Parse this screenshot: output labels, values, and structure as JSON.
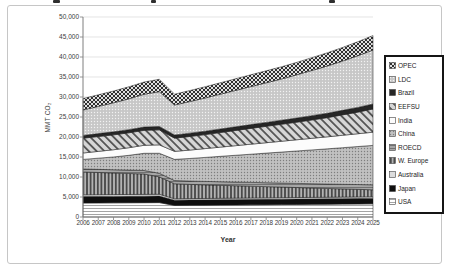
{
  "chart_data": {
    "type": "area",
    "stacked": true,
    "xlabel": "Year",
    "ylabel": "MMT CO2",
    "ylabel_display": "MMT CO₂",
    "x": [
      2006,
      2007,
      2008,
      2009,
      2010,
      2011,
      2012,
      2013,
      2014,
      2015,
      2016,
      2017,
      2018,
      2019,
      2020,
      2021,
      2022,
      2023,
      2024,
      2025
    ],
    "ylim": [
      0,
      50000
    ],
    "ytick_step": 5000,
    "y_tick_labels": [
      "0",
      "5,000",
      "10,000",
      "15,000",
      "20,000",
      "25,000",
      "30,000",
      "35,000",
      "40,000",
      "45,000",
      "50,000"
    ],
    "grid": true,
    "legend_position": "right",
    "legend_order_top_to_bottom": [
      "OPEC",
      "LDC",
      "Brazil",
      "EEFSU",
      "India",
      "China",
      "ROECD",
      "W. Europe",
      "Australia",
      "Japan",
      "USA"
    ],
    "series": [
      {
        "name": "USA",
        "pattern": "horizontal-lines",
        "values": [
          3500,
          3520,
          3540,
          3560,
          3580,
          3600,
          2900,
          2930,
          2960,
          2990,
          3020,
          3050,
          3080,
          3110,
          3140,
          3170,
          3200,
          3230,
          3260,
          3290
        ]
      },
      {
        "name": "Japan",
        "pattern": "solid-black",
        "values": [
          1600,
          1605,
          1610,
          1615,
          1620,
          1625,
          1300,
          1305,
          1310,
          1315,
          1320,
          1325,
          1330,
          1335,
          1340,
          1345,
          1350,
          1355,
          1360,
          1365
        ]
      },
      {
        "name": "Australia",
        "pattern": "light-gray",
        "values": [
          450,
          452,
          454,
          456,
          458,
          460,
          360,
          365,
          370,
          372,
          375,
          378,
          380,
          382,
          385,
          388,
          390,
          392,
          395,
          398
        ]
      },
      {
        "name": "W. Europe",
        "pattern": "vertical-stripes",
        "values": [
          5700,
          5550,
          5400,
          5250,
          5100,
          4350,
          3750,
          3550,
          3400,
          3250,
          3100,
          2950,
          2800,
          2650,
          2500,
          2350,
          2200,
          2050,
          1900,
          1750
        ]
      },
      {
        "name": "ROECD",
        "pattern": "gray-dashes",
        "values": [
          750,
          780,
          810,
          840,
          870,
          900,
          800,
          830,
          860,
          890,
          920,
          950,
          980,
          1010,
          1040,
          1070,
          1100,
          1150,
          1200,
          1250
        ]
      },
      {
        "name": "China",
        "pattern": "dense-dots",
        "values": [
          2400,
          2800,
          3200,
          3700,
          4300,
          5000,
          5300,
          5650,
          6000,
          6350,
          6700,
          7050,
          7400,
          7750,
          8100,
          8450,
          8800,
          9150,
          9500,
          9850
        ]
      },
      {
        "name": "India",
        "pattern": "white",
        "values": [
          1600,
          1700,
          1800,
          1900,
          2000,
          2100,
          2000,
          2100,
          2200,
          2300,
          2400,
          2500,
          2600,
          2700,
          2800,
          2900,
          3000,
          3100,
          3200,
          3300
        ]
      },
      {
        "name": "EEFSU",
        "pattern": "diagonal-hatch",
        "values": [
          3700,
          3710,
          3720,
          3730,
          3740,
          3750,
          3300,
          3400,
          3500,
          3650,
          3800,
          3950,
          4100,
          4250,
          4400,
          4600,
          4800,
          5100,
          5400,
          5800
        ]
      },
      {
        "name": "Brazil",
        "pattern": "solid-dark",
        "values": [
          700,
          730,
          760,
          790,
          820,
          850,
          800,
          830,
          860,
          890,
          920,
          950,
          980,
          1010,
          1040,
          1070,
          1100,
          1140,
          1190,
          1250
        ]
      },
      {
        "name": "LDC",
        "pattern": "fine-dots",
        "values": [
          6350,
          6800,
          7250,
          7700,
          8200,
          8700,
          7500,
          7900,
          8300,
          8700,
          9100,
          9500,
          9900,
          10300,
          10800,
          11300,
          11800,
          12300,
          12900,
          13500
        ]
      },
      {
        "name": "OPEC",
        "pattern": "cross-hatch",
        "values": [
          2850,
          2900,
          2950,
          3000,
          3050,
          3100,
          2700,
          2750,
          2800,
          2850,
          2900,
          2950,
          3000,
          3050,
          3100,
          3200,
          3300,
          3400,
          3500,
          3600
        ]
      }
    ],
    "patterns": {
      "horizontal-lines": {
        "type": "hlines",
        "bg": "#ffffff",
        "fg": "#9a9a9a"
      },
      "solid-black": {
        "type": "solid",
        "bg": "#0f0f0f"
      },
      "light-gray": {
        "type": "solid",
        "bg": "#dcdcdc"
      },
      "vertical-stripes": {
        "type": "vlines",
        "bg": "#b3b3b3",
        "fg": "#3d3d3d"
      },
      "gray-dashes": {
        "type": "hlines",
        "bg": "#a6a6a6",
        "fg": "#6b6b6b"
      },
      "dense-dots": {
        "type": "dots",
        "bg": "#c1c1c1",
        "fg": "#7e7e7e"
      },
      "white": {
        "type": "solid",
        "bg": "#fcfcfc"
      },
      "diagonal-hatch": {
        "type": "hatch",
        "bg": "#d6d6d6",
        "fg": "#3a3a3a"
      },
      "solid-dark": {
        "type": "solid",
        "bg": "#262626"
      },
      "fine-dots": {
        "type": "dots",
        "bg": "#c7c7c7",
        "fg": "#f2f2f2"
      },
      "cross-hatch": {
        "type": "cross",
        "bg": "#e0e0e0",
        "fg": "#1c1c1c"
      }
    },
    "axis_color": "#7f7f7f",
    "gridline_color": "#d9d9d9",
    "band_edge_color": "#1a1a1a"
  }
}
